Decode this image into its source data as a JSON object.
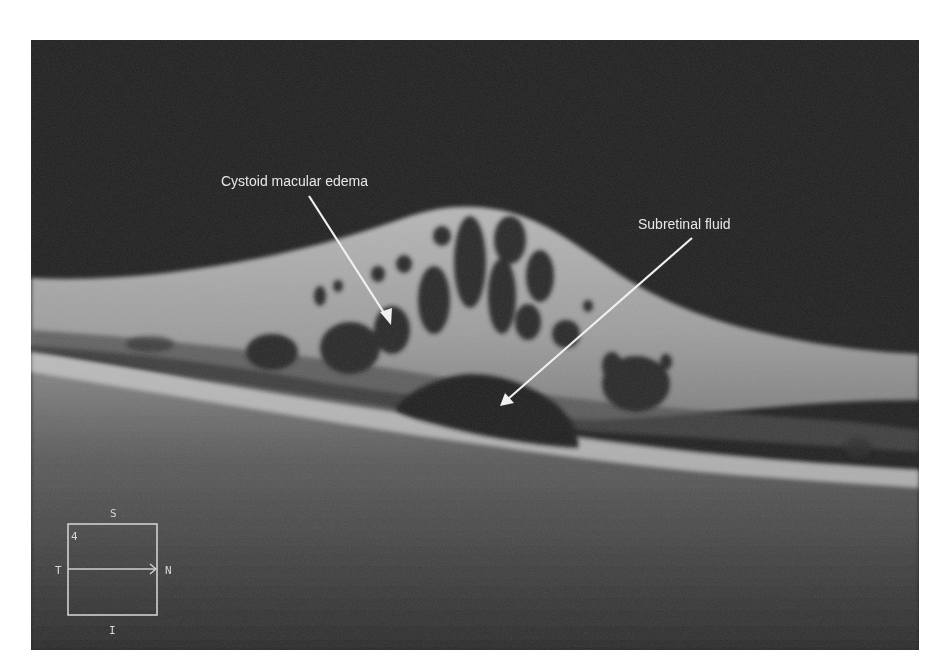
{
  "image": {
    "type": "OCT B-scan",
    "background": "#ffffff",
    "scan_background": "#1c1c1c"
  },
  "annotations": [
    {
      "label": "Cystoid macular edema",
      "text_x": 221,
      "text_y": 186,
      "arrow_from": [
        309,
        196
      ],
      "arrow_to": [
        390,
        324
      ]
    },
    {
      "label": "Subretinal fluid",
      "text_x": 638,
      "text_y": 229,
      "arrow_from": [
        692,
        238
      ],
      "arrow_to": [
        500,
        406
      ]
    }
  ],
  "orientation_box": {
    "top": "S",
    "bottom": "I",
    "left": "T",
    "right": "N",
    "number": "4"
  },
  "colors": {
    "annotation_text": "#e8e8e8",
    "arrow": "#f0f0f0",
    "orientation": "#d8d8d8"
  }
}
